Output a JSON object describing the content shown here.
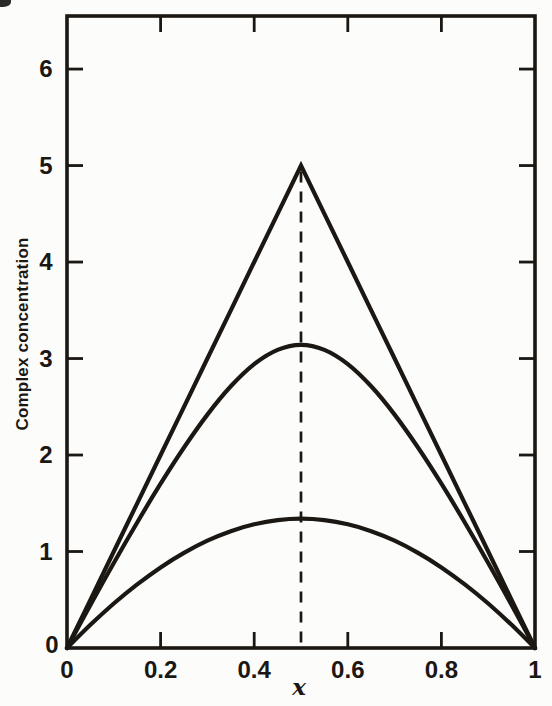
{
  "figure": {
    "background_color": "#fcfcfa",
    "line_color": "#1b1713"
  },
  "chart_data": {
    "type": "line",
    "title": "",
    "xlabel": "x",
    "ylabel": "Complex concentration",
    "xlim": [
      0,
      1
    ],
    "ylim": [
      0,
      6.55
    ],
    "grid": false,
    "legend": "none",
    "x_ticks": [
      0,
      0.2,
      0.4,
      0.6,
      0.8,
      1
    ],
    "x_tick_labels": [
      "0",
      "0.2",
      "0.4",
      "0.6",
      "0.8",
      "1"
    ],
    "y_ticks": [
      0,
      1,
      2,
      3,
      4,
      5,
      6
    ],
    "y_tick_labels": [
      "0",
      "1",
      "2",
      "3",
      "4",
      "5",
      "6"
    ],
    "x": [
      0,
      0.05,
      0.1,
      0.15,
      0.2,
      0.25,
      0.3,
      0.35,
      0.4,
      0.45,
      0.5,
      0.55,
      0.6,
      0.65,
      0.7,
      0.75,
      0.8,
      0.85,
      0.9,
      0.95,
      1
    ],
    "series": [
      {
        "name": "triangle-limit-curve",
        "shape": "linear",
        "peak": {
          "x": 0.5,
          "y": 5
        },
        "values": [
          0,
          0.5,
          1,
          1.5,
          2,
          2.5,
          3,
          3.5,
          4,
          4.5,
          5,
          4.5,
          4,
          3.5,
          3,
          2.5,
          2,
          1.5,
          1,
          0.5,
          0
        ]
      },
      {
        "name": "middle-curve",
        "shape": "smooth",
        "peak": {
          "x": 0.5,
          "y": 3.14
        },
        "values": [
          0,
          0.446,
          0.881,
          1.301,
          1.703,
          2.078,
          2.419,
          2.712,
          2.942,
          3.09,
          3.141,
          3.09,
          2.942,
          2.712,
          2.419,
          2.078,
          1.703,
          1.301,
          0.881,
          0.446,
          0
        ]
      },
      {
        "name": "lower-curve",
        "shape": "smooth",
        "peak": {
          "x": 0.5,
          "y": 1.34
        },
        "values": [
          0,
          0.24,
          0.461,
          0.659,
          0.835,
          0.986,
          1.112,
          1.211,
          1.282,
          1.325,
          1.34,
          1.325,
          1.282,
          1.211,
          1.112,
          0.986,
          0.835,
          0.659,
          0.461,
          0.24,
          0
        ]
      }
    ],
    "annotations": [
      {
        "type": "vline-dashed",
        "x": 0.5,
        "y_start": 0,
        "y_end": 5
      }
    ]
  }
}
